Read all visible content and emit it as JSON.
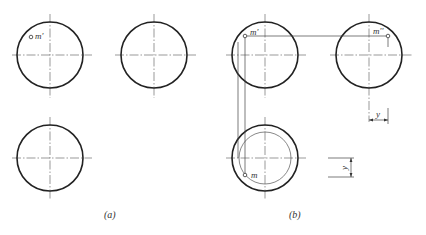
{
  "figure": {
    "panel_a": {
      "caption": "(a)",
      "front_view_point_label": "m'"
    },
    "panel_b": {
      "caption": "(b)",
      "front_view_point_label": "m'",
      "side_view_point_label": "m''",
      "top_view_point_label": "m",
      "dimension_top_label": "y",
      "dimension_bottom_label": "y"
    },
    "colors": {
      "outline": "#222222",
      "centerline": "#555555",
      "background": "#ffffff"
    }
  }
}
